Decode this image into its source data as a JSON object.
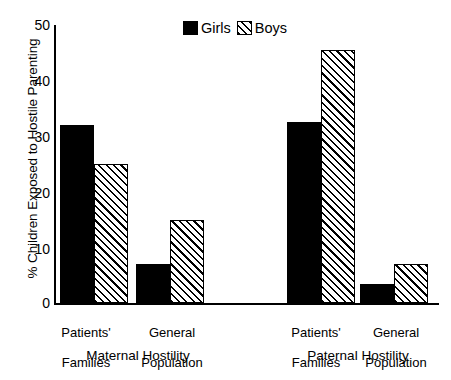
{
  "chart_data": {
    "type": "bar",
    "title": "",
    "xlabel": "",
    "ylabel": "% Children Exposed to Hostile Parenting",
    "ylim": [
      0,
      50
    ],
    "yticks": [
      0,
      10,
      20,
      30,
      40,
      50
    ],
    "grid": false,
    "legend_position": "top-center",
    "categories": [
      "Patients' Families",
      "General Population",
      "Patients' Families",
      "General Population"
    ],
    "groups": [
      {
        "name": "Maternal Hostility",
        "categories": [
          "Patients' Families",
          "General Population"
        ]
      },
      {
        "name": "Paternal Hostility",
        "categories": [
          "Patients' Families",
          "General Population"
        ]
      }
    ],
    "series": [
      {
        "name": "Girls",
        "fill": "solid-black",
        "color": "#000000",
        "values": [
          32,
          7,
          32.5,
          3.5
        ]
      },
      {
        "name": "Boys",
        "fill": "diagonal-hatch",
        "color": "#000000",
        "values": [
          25,
          15,
          45.5,
          7
        ]
      }
    ],
    "bars": [
      {
        "group": "Maternal Hostility",
        "category": "Patients' Families",
        "series": "Girls",
        "value": 32,
        "style": "girls"
      },
      {
        "group": "Maternal Hostility",
        "category": "Patients' Families",
        "series": "Boys",
        "value": 25,
        "style": "boys"
      },
      {
        "group": "Maternal Hostility",
        "category": "General Population",
        "series": "Girls",
        "value": 7,
        "style": "girls"
      },
      {
        "group": "Maternal Hostility",
        "category": "General Population",
        "series": "Boys",
        "value": 15,
        "style": "boys"
      },
      {
        "group": "Paternal Hostility",
        "category": "Patients' Families",
        "series": "Girls",
        "value": 32.5,
        "style": "girls"
      },
      {
        "group": "Paternal Hostility",
        "category": "Patients' Families",
        "series": "Boys",
        "value": 45.5,
        "style": "boys"
      },
      {
        "group": "Paternal Hostility",
        "category": "General Population",
        "series": "Girls",
        "value": 3.5,
        "style": "girls"
      },
      {
        "group": "Paternal Hostility",
        "category": "General Population",
        "series": "Boys",
        "value": 7,
        "style": "boys"
      }
    ]
  },
  "axis": {
    "y_title": "% Children Exposed to Hostile Parenting",
    "tick_labels": [
      "50",
      "40",
      "30",
      "20",
      "10",
      "0"
    ]
  },
  "legend": {
    "girls_label": "Girls",
    "boys_label": "Boys"
  },
  "category_labels": [
    {
      "line1": "Patients'",
      "line2": "Families"
    },
    {
      "line1": "General",
      "line2": "Population"
    },
    {
      "line1": "Patients'",
      "line2": "Families"
    },
    {
      "line1": "General",
      "line2": "Population"
    }
  ],
  "group_labels": [
    "Maternal Hostility",
    "Paternal Hostility"
  ]
}
